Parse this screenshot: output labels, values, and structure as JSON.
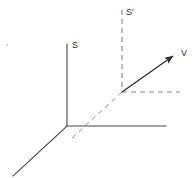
{
  "figure": {
    "kind": "vector-diagram",
    "title": "",
    "background_color": "#ffffff",
    "width": 196,
    "height": 178,
    "stroke_color": "#3a3a3a",
    "dashed_color": "#6e6e6e",
    "label_color": "#2b2b2b",
    "speck_color": "#d8d8d8"
  },
  "labels": {
    "s_axis": "S",
    "s_prime_axis": "S'",
    "vector": "V"
  },
  "geometry": {
    "origin": {
      "x": 67,
      "y": 126
    },
    "s_axis": {
      "x1": 67,
      "y1": 44,
      "x2": 67,
      "y2": 126
    },
    "x_axis": {
      "x1": 67,
      "y1": 126,
      "x2": 166,
      "y2": 126
    },
    "depth_axis": {
      "x1": 67,
      "y1": 126,
      "x2": 13,
      "y2": 176
    },
    "s_prime_axis": {
      "x1": 122,
      "y1": 10,
      "x2": 122,
      "y2": 92
    },
    "s_prime_origin": {
      "x": 122,
      "y": 92
    },
    "dashed_depth": {
      "x1": 122,
      "y1": 92,
      "x2": 71,
      "y2": 139
    },
    "dashed_horizontal": {
      "x1": 122,
      "y1": 92,
      "x2": 180,
      "y2": 92
    },
    "vector_arrow": {
      "x1": 122,
      "y1": 92,
      "x2": 177,
      "y2": 53
    },
    "speck": {
      "x": 7,
      "y": 45,
      "r": 1.2
    }
  },
  "label_positions": {
    "s_axis": {
      "x": 72,
      "y": 48
    },
    "s_prime_axis": {
      "x": 126,
      "y": 15
    },
    "vector": {
      "x": 181,
      "y": 56
    }
  },
  "style": {
    "solid_stroke_width": 1.1,
    "dashed_stroke_width": 1.0,
    "dash_pattern": "5,4",
    "arrow_stroke_width": 1.4
  }
}
